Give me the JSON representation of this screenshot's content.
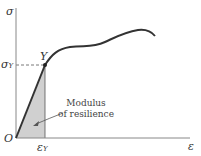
{
  "diagram": {
    "type": "stress-strain curve",
    "y_axis_label": "σ",
    "x_axis_label": "ε",
    "origin_label": "O",
    "yield_point_label": "Y",
    "yield_stress_label": "σ",
    "yield_stress_subscript": "Y",
    "yield_strain_label": "ε",
    "yield_strain_subscript": "Y",
    "annotation": {
      "line1": "Modulus",
      "line2": "of resilience"
    },
    "colors": {
      "curve": "#333333",
      "axis": "#777777",
      "shaded_area": "#cfcfcf",
      "dashed_line": "#555555"
    }
  }
}
